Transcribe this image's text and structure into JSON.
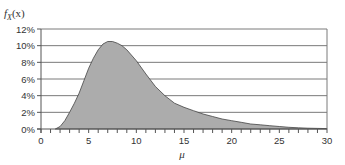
{
  "chart_data": {
    "type": "area",
    "title": "",
    "ylabel": "f_X(x)",
    "ylabel_main": "f",
    "ylabel_sub": "X",
    "ylabel_arg": "(x)",
    "xlabel": "μ",
    "xlim": [
      0,
      30
    ],
    "ylim": [
      0,
      12
    ],
    "x_ticks": [
      0,
      5,
      10,
      15,
      20,
      25,
      30
    ],
    "x_minor_step": 1,
    "y_ticks": [
      0,
      2,
      4,
      6,
      8,
      10,
      12
    ],
    "y_tick_labels": [
      "0%",
      "2%",
      "4%",
      "6%",
      "8%",
      "10%",
      "12%"
    ],
    "grid": "horizontal",
    "legend": null,
    "series": [
      {
        "name": "f_X(x)",
        "fill_color": "#acacac",
        "line_color": "#444444",
        "x": [
          1.5,
          2,
          2.5,
          3,
          3.5,
          4,
          4.5,
          5,
          5.5,
          6,
          6.5,
          7,
          7.5,
          8,
          8.5,
          9,
          10,
          11,
          12,
          13,
          14,
          15,
          16,
          17,
          18,
          19,
          20,
          21,
          22,
          23,
          24,
          25,
          26,
          27,
          28,
          29,
          30
        ],
        "values": [
          0.0,
          0.3,
          1.0,
          2.0,
          3.1,
          4.3,
          5.8,
          7.3,
          8.5,
          9.5,
          10.2,
          10.5,
          10.5,
          10.3,
          10.0,
          9.5,
          8.2,
          6.6,
          5.1,
          4.0,
          3.1,
          2.6,
          2.2,
          1.8,
          1.5,
          1.2,
          1.0,
          0.8,
          0.6,
          0.5,
          0.4,
          0.3,
          0.2,
          0.15,
          0.1,
          0.07,
          0.05
        ]
      }
    ]
  },
  "colors": {
    "grid": "#7a7a7a",
    "axis": "#555555",
    "fill": "#acacac"
  }
}
